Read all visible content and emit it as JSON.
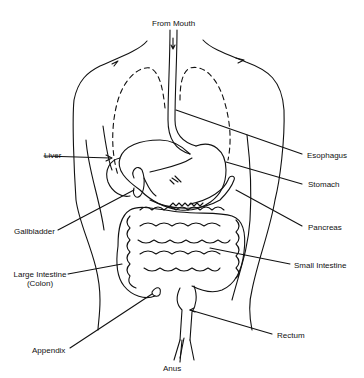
{
  "diagram": {
    "title_top": "From Mouth",
    "labels": {
      "liver": "Liver",
      "gallbladder": "Gallbladder",
      "large_intestine_line1": "Large Intestine",
      "large_intestine_line2": "(Colon)",
      "appendix": "Appendix",
      "anus": "Anus",
      "esophagus": "Esophagus",
      "stomach": "Stomach",
      "pancreas": "Pancreas",
      "small_intestine": "Small Intestine",
      "rectum": "Rectum"
    },
    "colors": {
      "line": "#111111",
      "background": "#ffffff"
    }
  }
}
